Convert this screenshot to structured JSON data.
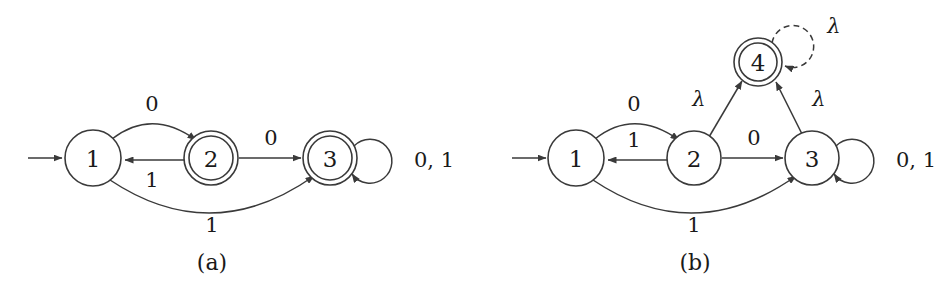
{
  "figure": {
    "background_color": "#ffffff",
    "stroke_color": "#3a3a3a",
    "text_color": "#1a1a1a",
    "panels": [
      {
        "id": "a",
        "caption": "(a)",
        "caption_pos": {
          "x": 212,
          "y": 262
        },
        "start_arrow": {
          "x1": 28,
          "y1": 158,
          "x2": 64,
          "y2": 158
        },
        "states": [
          {
            "name": "1",
            "x": 93,
            "y": 158,
            "r": 28,
            "accepting": false
          },
          {
            "name": "2",
            "x": 211,
            "y": 158,
            "r": 27,
            "accepting": true
          },
          {
            "name": "3",
            "x": 330,
            "y": 158,
            "r": 27,
            "accepting": true
          }
        ],
        "transitions": [
          {
            "from": "1",
            "to": "2",
            "label": "0",
            "label_x": 152,
            "label_y": 104,
            "kind": "arc-up"
          },
          {
            "from": "2",
            "to": "1",
            "label": "1",
            "label_x": 152,
            "label_y": 178,
            "kind": "straight"
          },
          {
            "from": "2",
            "to": "3",
            "label": "0",
            "label_x": 271,
            "label_y": 140,
            "kind": "straight"
          },
          {
            "from": "1",
            "to": "3",
            "label": "1",
            "label_x": 212,
            "label_y": 223,
            "kind": "arc-down"
          },
          {
            "from": "3",
            "to": "3",
            "label": "0, 1",
            "label_x": 412,
            "label_y": 160,
            "kind": "self-loop"
          }
        ]
      },
      {
        "id": "b",
        "caption": "(b)",
        "caption_pos": {
          "x": 695,
          "y": 262
        },
        "start_arrow": {
          "x1": 512,
          "y1": 158,
          "x2": 548,
          "y2": 158
        },
        "states": [
          {
            "name": "1",
            "x": 576,
            "y": 158,
            "r": 28,
            "accepting": false
          },
          {
            "name": "2",
            "x": 694,
            "y": 158,
            "r": 27,
            "accepting": false
          },
          {
            "name": "3",
            "x": 812,
            "y": 158,
            "r": 27,
            "accepting": false
          },
          {
            "name": "4",
            "x": 758,
            "y": 62,
            "r": 24,
            "accepting": true
          }
        ],
        "transitions": [
          {
            "from": "1",
            "to": "2",
            "label": "0",
            "label_x": 634,
            "label_y": 104,
            "kind": "arc-up"
          },
          {
            "from": "2",
            "to": "1",
            "label": "1",
            "label_x": 634,
            "label_y": 140,
            "kind": "straight"
          },
          {
            "from": "2",
            "to": "3",
            "label": "0",
            "label_x": 754,
            "label_y": 140,
            "kind": "straight"
          },
          {
            "from": "1",
            "to": "3",
            "label": "1",
            "label_x": 694,
            "label_y": 223,
            "kind": "arc-down"
          },
          {
            "from": "3",
            "to": "3",
            "label": "0, 1",
            "label_x": 895,
            "label_y": 160,
            "kind": "self-loop"
          },
          {
            "from": "2",
            "to": "4",
            "label": "λ",
            "label_x": 700,
            "label_y": 99,
            "kind": "straight"
          },
          {
            "from": "3",
            "to": "4",
            "label": "λ",
            "label_x": 818,
            "label_y": 99,
            "kind": "straight"
          },
          {
            "from": "4",
            "to": "4",
            "label": "λ",
            "label_x": 832,
            "label_y": 24,
            "kind": "self-loop-dashed"
          }
        ]
      }
    ]
  }
}
